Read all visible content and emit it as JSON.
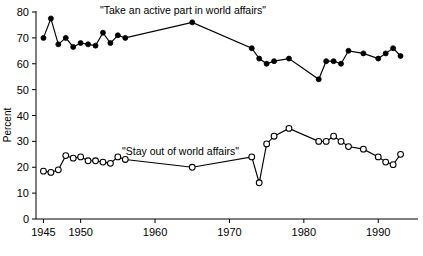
{
  "chart_data": {
    "type": "line",
    "title": "",
    "xlabel": "",
    "ylabel": "Percent",
    "xlim": [
      1944,
      1994
    ],
    "ylim": [
      0,
      80
    ],
    "ytick_step": 10,
    "yticks": [
      0,
      10,
      20,
      30,
      40,
      50,
      60,
      70,
      80
    ],
    "xticks": [
      1945,
      1950,
      1960,
      1970,
      1980,
      1990
    ],
    "xtick_labels": [
      "1945",
      "1950",
      "1960",
      "1970",
      "1980",
      "1990"
    ],
    "grid": false,
    "legend_position": "inline-annotations",
    "series": [
      {
        "name": "\"Take an active part in world affairs\"",
        "marker": "filled-circle",
        "annotation": "\"Take an active part in world affairs\"",
        "x": [
          1945,
          1946,
          1947,
          1948,
          1949,
          1950,
          1951,
          1952,
          1953,
          1954,
          1955,
          1956,
          1965,
          1973,
          1974,
          1975,
          1976,
          1978,
          1982,
          1983,
          1984,
          1985,
          1986,
          1988,
          1990,
          1991,
          1992,
          1993
        ],
        "values": [
          70,
          77.5,
          67.5,
          70,
          66.5,
          68,
          67.5,
          67,
          72,
          68,
          71,
          70,
          76,
          66,
          62,
          60,
          61,
          62,
          54,
          61,
          61,
          60,
          65,
          64,
          62,
          64,
          66,
          63
        ]
      },
      {
        "name": "\"Stay out of world affairs\"",
        "marker": "open-circle",
        "annotation": "\"Stay out of world affairs\"",
        "x": [
          1945,
          1946,
          1947,
          1948,
          1949,
          1950,
          1951,
          1952,
          1953,
          1954,
          1955,
          1956,
          1965,
          1973,
          1974,
          1975,
          1976,
          1978,
          1982,
          1983,
          1984,
          1985,
          1986,
          1988,
          1990,
          1991,
          1992,
          1993
        ],
        "values": [
          18.5,
          18,
          19,
          24.5,
          23.5,
          24,
          22.5,
          22.5,
          22,
          21.5,
          24,
          23,
          20,
          24,
          14,
          29,
          32,
          35,
          30,
          30,
          32,
          30,
          28,
          27,
          24,
          22,
          21,
          25
        ]
      }
    ],
    "annotations": [
      {
        "text": "\"Take an active part in world affairs\"",
        "x": 100,
        "y": 14
      },
      {
        "text": "\"Stay out of world affairs\"",
        "x": 122,
        "y": 155
      }
    ]
  },
  "axis": {
    "y_title": "Percent"
  }
}
